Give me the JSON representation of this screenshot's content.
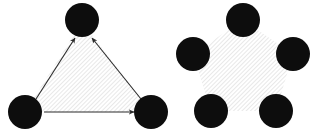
{
  "figure": {
    "canvas": {
      "width": 321,
      "height": 136,
      "background": "#ffffff"
    },
    "colors": {
      "node_fill": "#0d0d0d",
      "hatch_line": "#d8d8d8",
      "hatch_background": "#ffffff",
      "edge_stroke": "#2b2b2b",
      "arrow_fill": "#2b2b2b"
    },
    "hatch": {
      "angle_degrees": 45,
      "spacing_px": 3,
      "line_width_px": 1,
      "direction": "bottom-left-to-top-right"
    },
    "shapes": [
      {
        "id": "triangle",
        "name": "Triangle",
        "sides": 3,
        "filled": "hatched",
        "directed_edges": true,
        "node_radius": 17,
        "vertices": [
          {
            "label": "apex",
            "cx": 82,
            "cy": 20
          },
          {
            "label": "bottom-left",
            "cx": 25,
            "cy": 112
          },
          {
            "label": "bottom-right",
            "cx": 151,
            "cy": 112
          }
        ],
        "polygon_points": "82,22 25,112 151,112",
        "edges": [
          {
            "from": "bottom-left",
            "to": "apex",
            "x1": 36,
            "y1": 99,
            "x2": 75,
            "y2": 37,
            "arrow_at": "to"
          },
          {
            "from": "bottom-right",
            "to": "apex",
            "x1": 141,
            "y1": 99,
            "x2": 92,
            "y2": 37,
            "arrow_at": "to"
          },
          {
            "from": "bottom-left",
            "to": "bottom-right",
            "x1": 44,
            "y1": 112,
            "x2": 135,
            "y2": 112,
            "arrow_at": "to"
          }
        ]
      },
      {
        "id": "pentagon",
        "name": "Pentagon",
        "sides": 5,
        "filled": "hatched",
        "directed_edges": false,
        "node_radius": 17,
        "vertices": [
          {
            "label": "top",
            "cx": 243,
            "cy": 20
          },
          {
            "label": "right",
            "cx": 293,
            "cy": 54
          },
          {
            "label": "bottom-right",
            "cx": 276,
            "cy": 111
          },
          {
            "label": "bottom-left",
            "cx": 211,
            "cy": 111
          },
          {
            "label": "left",
            "cx": 193,
            "cy": 54
          }
        ],
        "polygon_points": "243,20 293,54 276,111 211,111 193,54",
        "edges": []
      }
    ]
  }
}
